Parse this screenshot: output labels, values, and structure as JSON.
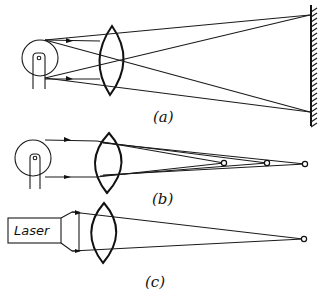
{
  "figure": {
    "panels": [
      {
        "id": "a",
        "label": "(a)",
        "source": "incandescent lamp",
        "element": "converging lens",
        "target": "screen",
        "description": "Light from an extended lamp filament is imaged by a lens onto a screen; rays cross forming an enlarged image"
      },
      {
        "id": "b",
        "label": "(b)",
        "source": "incandescent lamp",
        "element": "converging lens",
        "focal_points": 3,
        "description": "Lamp light focused by lens converges to multiple separate focal points"
      },
      {
        "id": "c",
        "label": "(c)",
        "source": "Laser",
        "source_label": "Laser",
        "element": "converging lens",
        "focal_points": 1,
        "description": "Collimated laser beam focused by lens to a single point"
      }
    ]
  }
}
